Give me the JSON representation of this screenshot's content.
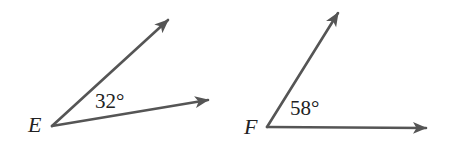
{
  "diagram": {
    "type": "angle-pair",
    "stroke_color": "#555555",
    "text_color": "#222222",
    "angles": [
      {
        "vertex_label": "E",
        "measure_label": "32°",
        "measure_degrees": 32,
        "vertex": [
          52,
          126
        ],
        "ray_tips": [
          [
            171,
            17
          ],
          [
            212,
            99
          ]
        ]
      },
      {
        "vertex_label": "F",
        "measure_label": "58°",
        "measure_degrees": 58,
        "vertex": [
          267,
          127
        ],
        "ray_tips": [
          [
            340,
            9
          ],
          [
            430,
            128
          ]
        ]
      }
    ]
  }
}
